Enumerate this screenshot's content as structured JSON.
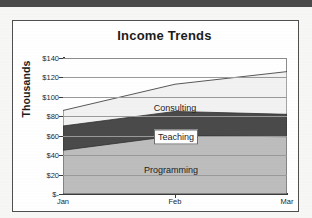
{
  "chart_data": {
    "type": "area",
    "stacked": true,
    "title": "Income Trends",
    "xlabel": "",
    "ylabel": "Thousands",
    "categories": [
      "Jan",
      "Feb",
      "Mar"
    ],
    "ylim": [
      0,
      140
    ],
    "ytick_labels": [
      "$140",
      "$120",
      "$100",
      "$80",
      "$60",
      "$40",
      "$20",
      "$-"
    ],
    "ytick_values": [
      140,
      120,
      100,
      80,
      60,
      40,
      20,
      0
    ],
    "grid": true,
    "grid_axis": "y",
    "legend": "inline-labels",
    "series": [
      {
        "name": "Programming",
        "values": [
          45,
          60,
          59
        ],
        "color": "#bdbdbd"
      },
      {
        "name": "Teaching",
        "values": [
          25,
          25,
          23
        ],
        "color": "#4a4a4a"
      },
      {
        "name": "Consulting",
        "values": [
          16,
          28,
          44
        ],
        "color": "#f2f2f2"
      }
    ],
    "cumulative_tops": {
      "Programming": [
        45,
        60,
        59
      ],
      "Teaching": [
        70,
        85,
        82
      ],
      "Consulting": [
        86,
        113,
        126
      ]
    },
    "annotations": [
      {
        "text": "Consulting",
        "boxed": false
      },
      {
        "text": "Teaching",
        "boxed": true
      },
      {
        "text": "Programming",
        "boxed": false
      }
    ]
  },
  "colors": {
    "programming": "#bdbdbd",
    "teaching": "#4a4a4a",
    "consulting": "#f2f2f2",
    "axis": "#3b3b3b",
    "grid": "#9a9a9a",
    "frame": "#4f4f4f",
    "text": "#1c1c1c",
    "page": "#f7f7f6",
    "scan_band": "#4a4a4a"
  }
}
